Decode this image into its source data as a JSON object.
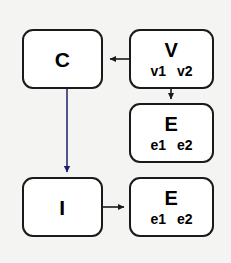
{
  "diagram": {
    "title": "",
    "background_color": "#f4f4f2",
    "node_fill": "#ffffff",
    "node_border_color": "#1a1a1a",
    "nodes": [
      {
        "id": "c",
        "label": "C",
        "sublabels": []
      },
      {
        "id": "v",
        "label": "V",
        "sublabels": [
          "v1",
          "v2"
        ]
      },
      {
        "id": "e1",
        "label": "E",
        "sublabels": [
          "e1",
          "e2"
        ]
      },
      {
        "id": "i",
        "label": "I",
        "sublabels": []
      },
      {
        "id": "e2",
        "label": "E",
        "sublabels": [
          "e1",
          "e2"
        ]
      }
    ],
    "edges": [
      {
        "id": "v-to-c",
        "from": "v",
        "to": "c",
        "direction": "left",
        "color": "#1a1a1a"
      },
      {
        "id": "v-to-e",
        "from": "v",
        "to": "e1",
        "direction": "down",
        "color": "#1a1a1a"
      },
      {
        "id": "c-to-i",
        "from": "c",
        "to": "i",
        "direction": "down",
        "color": "#1c1c6e"
      },
      {
        "id": "i-to-e",
        "from": "i",
        "to": "e2",
        "direction": "right",
        "color": "#1a1a1a"
      }
    ]
  }
}
